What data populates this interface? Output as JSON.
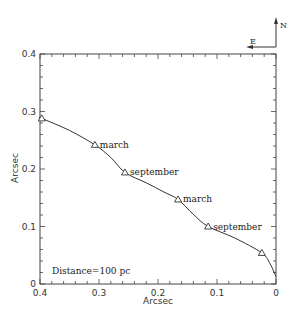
{
  "chart_data": {
    "type": "line",
    "title": "",
    "xlabel": "Arcsec",
    "ylabel": "Arcsec",
    "xlim": [
      0.4,
      0
    ],
    "ylim": [
      0,
      0.4
    ],
    "x_reversed": true,
    "grid": false,
    "xticks": [
      "0.4",
      "0.3",
      "0.2",
      "0.1",
      "0"
    ],
    "yticks": [
      "0",
      "0.1",
      "0.2",
      "0.3",
      "0.4"
    ],
    "series": [
      {
        "name": "trajectory",
        "curve": [
          [
            0.4,
            0.289
          ],
          [
            0.397,
            0.288
          ],
          [
            0.35,
            0.267
          ],
          [
            0.307,
            0.242
          ],
          [
            0.28,
            0.22
          ],
          [
            0.256,
            0.194
          ],
          [
            0.22,
            0.176
          ],
          [
            0.19,
            0.16
          ],
          [
            0.166,
            0.147
          ],
          [
            0.14,
            0.121
          ],
          [
            0.115,
            0.1
          ],
          [
            0.07,
            0.08
          ],
          [
            0.024,
            0.054
          ],
          [
            0.01,
            0.035
          ],
          [
            0.0,
            0.013
          ]
        ],
        "markers": [
          {
            "x": 0.397,
            "y": 0.288,
            "label": ""
          },
          {
            "x": 0.307,
            "y": 0.242,
            "label": "march"
          },
          {
            "x": 0.256,
            "y": 0.194,
            "label": "september"
          },
          {
            "x": 0.166,
            "y": 0.147,
            "label": "march"
          },
          {
            "x": 0.115,
            "y": 0.1,
            "label": "september"
          },
          {
            "x": 0.024,
            "y": 0.054,
            "label": ""
          }
        ]
      }
    ],
    "annotations": [
      {
        "text": "Distance=100 pc",
        "x": 0.38,
        "y": 0.02
      }
    ],
    "compass": {
      "north": "N",
      "east": "E"
    }
  }
}
